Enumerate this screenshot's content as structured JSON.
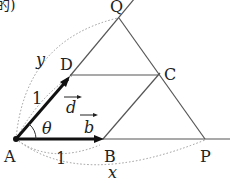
{
  "diagram": {
    "fragment_text": "的)",
    "points": {
      "A": "A",
      "B": "B",
      "C": "C",
      "D": "D",
      "P": "P",
      "Q": "Q"
    },
    "labels": {
      "x": "x",
      "y": "y",
      "theta": "θ",
      "vec_b": "b",
      "vec_d": "d",
      "len_AB": "1",
      "len_AD": "1"
    },
    "colors": {
      "line": "#555555",
      "vector": "#111111",
      "dotted": "#999999",
      "text": "#222222"
    }
  }
}
